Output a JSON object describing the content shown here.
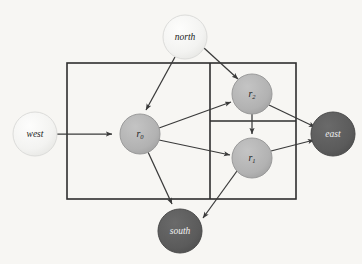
{
  "figure": {
    "type": "directed-graphical-model",
    "background_color": "#f7f6f3",
    "stroke_color": "#3a3a3a"
  },
  "nodes": {
    "north": {
      "label": "north",
      "cx": 185,
      "cy": 37,
      "r": 22,
      "fill": "#f4f4f2",
      "stroke": "#d8d8d6",
      "text_color": "#1d1d1d",
      "kind": "observed-light"
    },
    "west": {
      "label": "west",
      "cx": 35,
      "cy": 134,
      "r": 22,
      "fill": "#f4f4f2",
      "stroke": "#d8d8d6",
      "text_color": "#1d1d1d",
      "kind": "observed-light"
    },
    "east": {
      "label": "east",
      "cx": 333,
      "cy": 134,
      "r": 22,
      "fill": "#5c5c5c",
      "stroke": "#4a4a4a",
      "text_color": "#f0f0f0",
      "kind": "observed-dark"
    },
    "south": {
      "label": "south",
      "cx": 180,
      "cy": 231,
      "r": 22,
      "fill": "#5c5c5c",
      "stroke": "#4a4a4a",
      "text_color": "#f0f0f0",
      "kind": "observed-dark"
    },
    "r0": {
      "label": "r",
      "subscript": "0",
      "cx": 140,
      "cy": 134,
      "r": 20,
      "fill": "#b4b4b4",
      "stroke": "#8c8c8c",
      "text_color": "#1d1d1d",
      "kind": "latent"
    },
    "r1": {
      "label": "r",
      "subscript": "1",
      "cx": 252,
      "cy": 158,
      "r": 20,
      "fill": "#b4b4b4",
      "stroke": "#8c8c8c",
      "text_color": "#1d1d1d",
      "kind": "latent"
    },
    "r2": {
      "label": "r",
      "subscript": "2",
      "cx": 252,
      "cy": 94,
      "r": 20,
      "fill": "#b4b4b4",
      "stroke": "#8c8c8c",
      "text_color": "#1d1d1d",
      "kind": "latent"
    }
  },
  "plates": {
    "outer": {
      "x": 67,
      "y": 63,
      "width": 229,
      "height": 136
    },
    "divider_vertical": {
      "x": 210,
      "y1": 63,
      "y2": 199
    },
    "divider_horizontal": {
      "x1": 210,
      "x2": 296,
      "y": 121
    }
  },
  "edges": [
    {
      "from": "west",
      "to": "r0",
      "name": "edge-west-to-r0"
    },
    {
      "from": "north",
      "to": "r0",
      "name": "edge-north-to-r0"
    },
    {
      "from": "north",
      "to": "r2",
      "name": "edge-north-to-r2"
    },
    {
      "from": "r0",
      "to": "r2",
      "name": "edge-r0-to-r2"
    },
    {
      "from": "r0",
      "to": "r1",
      "name": "edge-r0-to-r1"
    },
    {
      "from": "r0",
      "to": "south",
      "name": "edge-r0-to-south"
    },
    {
      "from": "r2",
      "to": "r1",
      "name": "edge-r2-to-r1"
    },
    {
      "from": "r2",
      "to": "east",
      "name": "edge-r2-to-east"
    },
    {
      "from": "r1",
      "to": "east",
      "name": "edge-r1-to-east"
    },
    {
      "from": "r1",
      "to": "south",
      "name": "edge-r1-to-south"
    }
  ]
}
